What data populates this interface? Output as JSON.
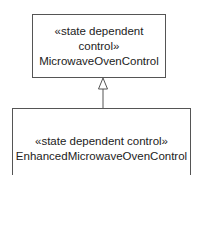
{
  "diagram": {
    "type": "uml-class-generalization",
    "superclass": {
      "stereotype_line1": "«state dependent",
      "stereotype_line2": "control»",
      "name": "MicrowaveOvenControl"
    },
    "subclass": {
      "stereotype": "«state dependent control»",
      "name": "EnhancedMicrowaveOvenControl"
    },
    "relationship": "generalization"
  }
}
